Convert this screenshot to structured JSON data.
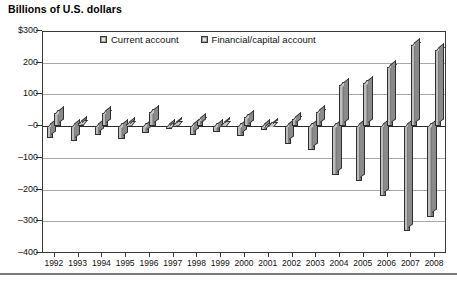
{
  "title": "Billions of U.S. dollars",
  "legend": {
    "position": "top-center",
    "items": [
      {
        "label": "Current account",
        "color": "#9b9b9b"
      },
      {
        "label": "Financial/capital account",
        "color": "#9b9b9b"
      }
    ]
  },
  "axis": {
    "y_ticks": [
      "$300",
      "200",
      "100",
      "–0",
      "–100",
      "–200",
      "–300",
      "–400"
    ],
    "y_values": [
      300,
      200,
      100,
      0,
      -100,
      -200,
      -300,
      -400
    ],
    "y_min": -400,
    "y_max": 300
  },
  "chart_data": {
    "type": "bar",
    "title": "Billions of U.S. dollars",
    "xlabel": "",
    "ylabel": "Billions of U.S. dollars",
    "ylim": [
      -400,
      300
    ],
    "grid": true,
    "legend_position": "top-center",
    "categories": [
      "1992",
      "1993",
      "1994",
      "1995",
      "1996",
      "1997",
      "1998",
      "1999",
      "2000",
      "2001",
      "2002",
      "2003",
      "2004",
      "2005",
      "2006",
      "2007",
      "2008"
    ],
    "series": [
      {
        "name": "Current account",
        "color": "#9b9b9b",
        "values": [
          -50,
          -85,
          -122,
          -114,
          -125,
          -141,
          -215,
          -302,
          -417,
          -398,
          -459,
          -522,
          -631,
          -748,
          -804,
          -727,
          -706
        ]
      },
      {
        "name": "Financial/capital account",
        "color": "#9b9b9b",
        "values": [
          44,
          82,
          124,
          110,
          131,
          146,
          213,
          299,
          413,
          391,
          453,
          520,
          628,
          745,
          800,
          723,
          700
        ]
      }
    ],
    "note": "Bars are mirrored: current account deficits below zero, financial/capital account surpluses above zero. Values rendered to the chart's visible scale are listed in rendered_values."
  },
  "rendered_values": {
    "categories": [
      "1992",
      "1993",
      "1994",
      "1995",
      "1996",
      "1997",
      "1998",
      "1999",
      "2000",
      "2001",
      "2002",
      "2003",
      "2004",
      "2005",
      "2006",
      "2007",
      "2008"
    ],
    "current_account": [
      -38,
      -48,
      -28,
      -42,
      -22,
      -10,
      -27,
      -20,
      -32,
      -12,
      -55,
      -75,
      -155,
      -172,
      -220,
      -330,
      -285
    ],
    "financial_capital_account": [
      40,
      10,
      42,
      8,
      45,
      7,
      18,
      6,
      30,
      4,
      22,
      45,
      130,
      135,
      185,
      255,
      240
    ]
  },
  "x_labels": [
    "1992",
    "1993",
    "1994",
    "1995",
    "1996",
    "1997",
    "1998",
    "1999",
    "2000",
    "2001",
    "2002",
    "2003",
    "2004",
    "2005",
    "2006",
    "2007",
    "2008"
  ]
}
